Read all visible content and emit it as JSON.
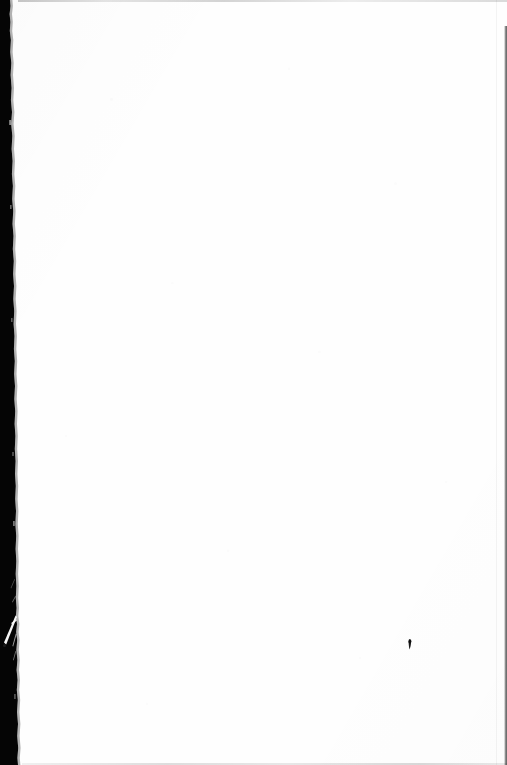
{
  "page": {
    "kind": "scanned-document-page",
    "content_state": "blank",
    "body_text": "",
    "width_px": 507,
    "height_px": 765,
    "paper_color": "#fefefe"
  },
  "scan_artifacts": {
    "left_gutter": {
      "name": "left-scan-gutter",
      "color": "#050505",
      "min_width_px": 8,
      "max_width_px": 17,
      "edge": "torn-irregular"
    },
    "right_edge_line": {
      "name": "right-scan-edge",
      "color": "#2b2b2b",
      "width_px": 2,
      "starts_at_y_px": 26
    },
    "top_edge_line": {
      "name": "top-scan-edge",
      "color": "#c9c9c9",
      "height_px": 2
    },
    "bottom_edge_line": {
      "name": "bottom-scan-edge",
      "color": "#d4d4d4",
      "height_px": 2
    },
    "tear_slash": {
      "name": "gutter-tear-slash",
      "color": "#ffffff",
      "approx_y_px": 628
    },
    "ink_speck": {
      "name": "ink-speck",
      "color": "#1c1c1c",
      "x_px": 409,
      "y_px": 640,
      "width_px": 4,
      "height_px": 11
    },
    "gutter_dot": {
      "name": "gutter-dot",
      "color": "#1a1a1a",
      "x_px": 4,
      "y_px": 646,
      "diameter_px": 3
    }
  }
}
